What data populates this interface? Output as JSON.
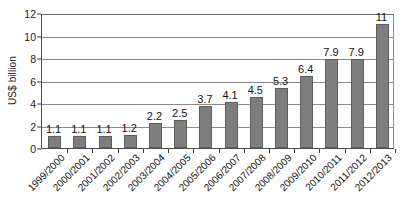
{
  "chart_data": {
    "type": "bar",
    "title": "",
    "subtitle": "",
    "xlabel": "",
    "ylabel": "US$ billion",
    "ylim": [
      0,
      12
    ],
    "yticks": [
      0,
      2,
      4,
      6,
      8,
      10,
      12
    ],
    "ytick_labels": [
      "0",
      "2",
      "4",
      "6",
      "8",
      "10",
      "12"
    ],
    "grid": true,
    "legend": false,
    "legend_position": "none",
    "orientation": "vertical",
    "bar_color": "#7e7e7e",
    "bar_edge_color": "#5d5d5d",
    "axis_color": "#4d4d4d",
    "gridline_color": "#8a8a8a",
    "data_labels_shown": true,
    "categories": [
      "1999/2000",
      "2000/2001",
      "2001/2002",
      "2002/2003",
      "2003/2004",
      "2004/2005",
      "2005/2006",
      "2006/2007",
      "2007/2008",
      "2008/2009",
      "2009/2010",
      "2010/2011",
      "2011/2012",
      "2012/2013"
    ],
    "values": [
      1.1,
      1.1,
      1.1,
      1.2,
      2.2,
      2.5,
      3.7,
      4.1,
      4.5,
      5.3,
      6.4,
      7.9,
      7.9,
      11
    ],
    "value_labels": [
      "1.1",
      "1.1",
      "1.1",
      "1.2",
      "2.2",
      "2.5",
      "3.7",
      "4.1",
      "4.5",
      "5.3",
      "6.4",
      "7.9",
      "7.9",
      "11"
    ]
  }
}
